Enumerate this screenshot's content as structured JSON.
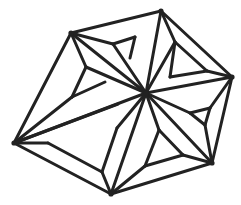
{
  "figure": {
    "type": "geometric-star-pattern",
    "stroke_color": "#222222",
    "background": "#ffffff",
    "center": [
      146,
      93
    ],
    "outer_vertices": [
      [
        71,
        33
      ],
      [
        161,
        11
      ],
      [
        232,
        77
      ],
      [
        212,
        163
      ],
      [
        111,
        194
      ],
      [
        14,
        143
      ]
    ],
    "edges": [
      [
        [
          71,
          33
        ],
        [
          161,
          11
        ]
      ],
      [
        [
          161,
          11
        ],
        [
          232,
          77
        ]
      ],
      [
        [
          232,
          77
        ],
        [
          212,
          163
        ]
      ],
      [
        [
          212,
          163
        ],
        [
          111,
          194
        ]
      ],
      [
        [
          111,
          194
        ],
        [
          14,
          143
        ]
      ],
      [
        [
          14,
          143
        ],
        [
          71,
          33
        ]
      ],
      [
        [
          71,
          33
        ],
        [
          146,
          93
        ]
      ],
      [
        [
          161,
          11
        ],
        [
          146,
          93
        ]
      ],
      [
        [
          232,
          77
        ],
        [
          146,
          93
        ]
      ],
      [
        [
          212,
          163
        ],
        [
          146,
          93
        ]
      ],
      [
        [
          111,
          194
        ],
        [
          146,
          93
        ]
      ],
      [
        [
          14,
          143
        ],
        [
          146,
          93
        ]
      ],
      [
        [
          71,
          33
        ],
        [
          113,
          44
        ]
      ],
      [
        [
          113,
          44
        ],
        [
          146,
          93
        ]
      ],
      [
        [
          113,
          44
        ],
        [
          135,
          37
        ]
      ],
      [
        [
          135,
          37
        ],
        [
          130,
          58
        ]
      ],
      [
        [
          71,
          33
        ],
        [
          86,
          67
        ]
      ],
      [
        [
          86,
          67
        ],
        [
          146,
          93
        ]
      ],
      [
        [
          86,
          67
        ],
        [
          72,
          97
        ]
      ],
      [
        [
          72,
          97
        ],
        [
          105,
          82
        ]
      ],
      [
        [
          161,
          11
        ],
        [
          175,
          42
        ]
      ],
      [
        [
          175,
          42
        ],
        [
          146,
          93
        ]
      ],
      [
        [
          175,
          42
        ],
        [
          170,
          77
        ]
      ],
      [
        [
          175,
          42
        ],
        [
          207,
          71
        ]
      ],
      [
        [
          232,
          77
        ],
        [
          207,
          71
        ]
      ],
      [
        [
          207,
          71
        ],
        [
          170,
          77
        ]
      ],
      [
        [
          232,
          77
        ],
        [
          210,
          108
        ]
      ],
      [
        [
          210,
          108
        ],
        [
          190,
          113
        ]
      ],
      [
        [
          190,
          113
        ],
        [
          146,
          93
        ]
      ],
      [
        [
          210,
          108
        ],
        [
          205,
          125
        ]
      ],
      [
        [
          212,
          163
        ],
        [
          205,
          125
        ]
      ],
      [
        [
          205,
          125
        ],
        [
          190,
          113
        ]
      ],
      [
        [
          212,
          163
        ],
        [
          183,
          155
        ]
      ],
      [
        [
          183,
          155
        ],
        [
          159,
          130
        ]
      ],
      [
        [
          159,
          130
        ],
        [
          146,
          93
        ]
      ],
      [
        [
          159,
          130
        ],
        [
          145,
          166
        ]
      ],
      [
        [
          111,
          194
        ],
        [
          145,
          166
        ]
      ],
      [
        [
          145,
          166
        ],
        [
          183,
          155
        ]
      ],
      [
        [
          111,
          194
        ],
        [
          102,
          172
        ]
      ],
      [
        [
          102,
          172
        ],
        [
          117,
          128
        ]
      ],
      [
        [
          117,
          128
        ],
        [
          146,
          93
        ]
      ],
      [
        [
          102,
          172
        ],
        [
          48,
          143
        ]
      ],
      [
        [
          48,
          143
        ],
        [
          14,
          143
        ]
      ],
      [
        [
          14,
          143
        ],
        [
          72,
          97
        ]
      ],
      [
        [
          14,
          143
        ],
        [
          118,
          104
        ]
      ]
    ]
  }
}
